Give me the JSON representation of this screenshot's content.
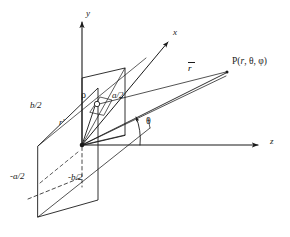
{
  "figure": {
    "kind": "3d-coordinate-diagram",
    "background_color": "#ffffff",
    "line_color": "#1a1a1a",
    "axes": [
      {
        "id": "y",
        "label": "y",
        "direction": "up",
        "tip": [
          82,
          17
        ],
        "origin": [
          82,
          145
        ]
      },
      {
        "id": "x",
        "label": "x",
        "direction": "upper-right",
        "tip": [
          170,
          40
        ],
        "origin": [
          82,
          145
        ]
      },
      {
        "id": "z",
        "label": "z",
        "direction": "right",
        "tip": [
          262,
          145
        ],
        "origin": [
          82,
          145
        ]
      }
    ],
    "axis_labels": {
      "y": {
        "text": "y",
        "x": 86,
        "y": 13
      },
      "x": {
        "text": "x",
        "x": 174,
        "y": 32
      },
      "z": {
        "text": "z",
        "x": 272,
        "y": 140
      }
    },
    "dimension_labels": [
      {
        "id": "b-over-2-upper",
        "text": "b/2",
        "x": 34,
        "y": 107
      },
      {
        "id": "a-over-2-upper",
        "text": "a/2",
        "x": 115,
        "y": 96
      },
      {
        "id": "minus-a-over-2",
        "text": "-a/2",
        "x": 14,
        "y": 178
      },
      {
        "id": "minus-b-over-2",
        "text": "-b/2",
        "x": 72,
        "y": 179
      }
    ],
    "vector_labels": [
      {
        "id": "r-source-prime",
        "text": "r",
        "prime": "'",
        "overbar": false,
        "x": 62,
        "y": 118
      },
      {
        "id": "r-field-vector",
        "text": "r",
        "prime": "",
        "overbar": true,
        "x": 189,
        "y": 69
      }
    ],
    "greek_labels": [
      {
        "id": "rho-label",
        "text": "ρ",
        "x": 84,
        "y": 96
      },
      {
        "id": "theta-label",
        "text": "θ",
        "x": 148,
        "y": 123
      }
    ],
    "point_label": {
      "id": "field-point",
      "prefix": "P(",
      "r": "r",
      "sep1": ", ",
      "theta": "θ",
      "sep2": ", ",
      "phi": "φ",
      "suffix": ")",
      "full_text": "P(r, θ, φ)",
      "x": 232,
      "y": 63
    },
    "markers": [
      {
        "id": "origin-dot",
        "x": 82,
        "y": 145,
        "r": 2.2,
        "filled": true
      },
      {
        "id": "source-point-circle",
        "x": 96,
        "y": 104,
        "r": 2.6,
        "filled": false
      },
      {
        "id": "field-point-dot",
        "x": 228,
        "y": 72,
        "r": 1.6,
        "filled": true
      }
    ],
    "aperture_plane": {
      "id": "large-parallelogram",
      "points": "38,146 98,88 98,200 38,217",
      "note": "lower-left plane containing -a/2 and -b/2 edges"
    },
    "inner_rect": {
      "id": "upper-rectangle",
      "points": "82,145 82,78 125,68 125,135",
      "note": "vertical rectangle above the z axis"
    },
    "dashes": [
      {
        "id": "dashed-vertical-b",
        "x1": 82,
        "y1": 146,
        "x2": 82,
        "y2": 186
      },
      {
        "id": "dashed-diagonal",
        "x1": 30,
        "y1": 197,
        "x2": 80,
        "y2": 176
      }
    ],
    "theta_arc": {
      "id": "theta-arc",
      "cx": 82,
      "cy": 145,
      "r": 58,
      "note": "angle from z axis up to r vector"
    }
  }
}
